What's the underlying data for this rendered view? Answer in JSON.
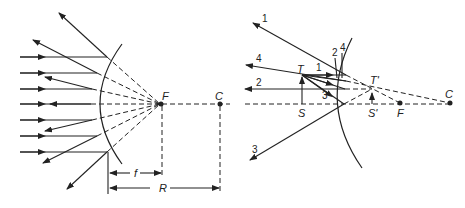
{
  "figure": {
    "left_panel": {
      "name": "concave-mirror-parallel-rays",
      "labels": {
        "focus": "F",
        "center": "C",
        "focal_length": "f",
        "radius": "R"
      }
    },
    "right_panel": {
      "name": "convex-mirror-image-formation",
      "labels": {
        "object_top": "T",
        "object_base": "S",
        "image_top": "T'",
        "image_base": "S'",
        "focus": "F",
        "center": "C"
      },
      "ray_numbers": [
        "1",
        "2",
        "3",
        "4"
      ],
      "ray_labels_near_mirror": [
        "2",
        "4"
      ]
    },
    "colors": {
      "ink": "#222222",
      "background": "#ffffff"
    }
  }
}
